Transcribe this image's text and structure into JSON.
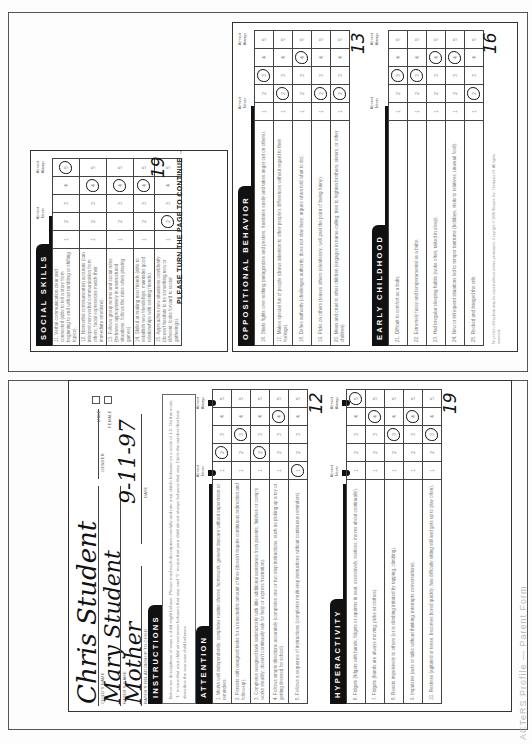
{
  "form": {
    "fields": {
      "child_name_label": "CHILD'S NAME",
      "child_name": "Chris   Student",
      "rater_name_label": "RATER'S NAME",
      "rater_name": "Mary   Student",
      "relationship_label": "RATER'S RELATIONSHIP TO CHILD",
      "relationship": "Mother",
      "date_label": "DATE",
      "date": "9-11-97",
      "gender_label": "GENDER",
      "male_label": "MALE",
      "female_label": "FEMALE"
    },
    "instructions": {
      "title": "INSTRUCTIONS",
      "text": "Below are descriptions of ways a child might behave. Please read each description carefully and rate your child's behavior on a scale of 1-5. On this scale, \"1\" means that your child almost never behaves that way, and \"5\" means that your child almost always behaves that way. Circle the number that best describes the way your child behaves."
    },
    "scale": {
      "low_label": "Almost Never",
      "high_label": "Almost Always",
      "options": [
        "1",
        "2",
        "3",
        "4",
        "5"
      ]
    },
    "sections": [
      {
        "title": "ATTENTION",
        "score": "12",
        "items": [
          {
            "n": "1",
            "text": "Works well independently; completes routine chores, homework, general daycare without supervision or reminders.",
            "circled": 2
          },
          {
            "n": "2",
            "text": "Persists with assigned tasks for a reasonable amount of time (doesn't require continuous redirection and follow-up).",
            "circled": 3
          },
          {
            "n": "3",
            "text": "Completes assigned task satisfactorily with little additional assistance from parents; finishes or comp's works steadily; doesn't continually ask for help or express frustration).",
            "circled": 2
          },
          {
            "n": "4",
            "text": "Follows simple directions accurately (completes one or two step instructions, such as picking up a toy or getting dressed for school).",
            "circled": 4
          },
          {
            "n": "5",
            "text": "Follows a sequence of instructions (completes multi-step instructions without continuous reminders).",
            "circled": 1
          }
        ]
      },
      {
        "title": "HYPERACTIVITY",
        "score": "19",
        "items": [
          {
            "n": "6",
            "text": "Fidgets (fidgets with hands, fidgets or squirms in seat, excessively, restless, moves about continually).",
            "circled": 5
          },
          {
            "n": "7",
            "text": "Fidgets (hands are always moving; picks at clothes).",
            "circled": 4
          },
          {
            "n": "8",
            "text": "Reacts impulsively to others (or is climbing irritated by tapping, climbing).",
            "circled": 3
          },
          {
            "n": "9",
            "text": "Impulsive (acts or talks without thinking; interrupts conversations).",
            "circled": 4
          },
          {
            "n": "10",
            "text": "Restless (agitated or tense; becomes bored quickly; has difficulty sitting still and gets up to play often).",
            "circled": 3
          }
        ]
      },
      {
        "title": "SOCIAL SKILLS",
        "score": "19",
        "items": [
          {
            "n": "11",
            "text": "Verbal communication clear and connected (able to tell a story from beginning to end without rambling or shifting topics).",
            "circled": 5
          },
          {
            "n": "12",
            "text": "Nonverbal communication accurate (can interpret non-verbal communication from others; facial expressions match their immediate emotions).",
            "circled": 4
          },
          {
            "n": "13",
            "text": "Follows group norms and social rules (behaves appropriately in unstructured situations; follows the rules when playing games).",
            "circled": 4
          },
          {
            "n": "14",
            "text": "Skilled at making new friends (able to establish new friendships; maintains good relationships with existing friends).",
            "circled": 4
          },
          {
            "n": "15",
            "text": "Approaches new situations confidently (doesn't hesitate to try something new or different; looks forward to social gatherings).",
            "circled": 2
          }
        ]
      },
      {
        "title": "OPPOSITIONAL BEHAVIOR",
        "score": "13",
        "items": [
          {
            "n": "16",
            "text": "Starts fights over nothing (antagonizes and pesters; frustrates easily and takes anger out on others).",
            "circled": 3
          },
          {
            "n": "17",
            "text": "Makes special fun of people (draws attention to other people's differences without regard to their feelings).",
            "circled": 2
          },
          {
            "n": "18",
            "text": "Defies authority (challenges authority; does not stay busy; argues when told what to do).",
            "circled": 4
          },
          {
            "n": "19",
            "text": "Picks on others (teases others relentlessly; well past the point of being funny).",
            "circled": 2
          },
          {
            "n": "20",
            "text": "Mean and cruel to other children (engages in name-calling; tries to frighten brothers, sisters, or other children).",
            "circled": 2
          }
        ]
      },
      {
        "title": "EARLY CHILDHOOD",
        "score": "16",
        "items": [
          {
            "n": "21",
            "text": "Difficult to comfort as a baby.",
            "circled": 3
          },
          {
            "n": "22",
            "text": "Extremely fussy and temperamental as a baby.",
            "circled": 3
          },
          {
            "n": "23",
            "text": "Had irregular sleeping habits (woke often; talked in sleep).",
            "circled": 4
          },
          {
            "n": "24",
            "text": "New or infrequent situations led to temper tantrums (holidays, visits to relatives, unusual food).",
            "circled": 4
          },
          {
            "n": "25",
            "text": "Rocked and banged the crib.",
            "circled": 2
          }
        ]
      }
    ],
    "continue_text": "PLEASE TURN THE PAGE TO CONTINUE →",
    "copyright": "No portion of this form may be copied without written permission. Copyright © 1996 Slosson Inc. Thompson R. All rights reserved.",
    "footer_text": "ACTeRS Profile — Parent Form"
  }
}
